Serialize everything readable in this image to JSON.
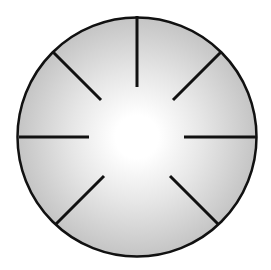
{
  "diagram": {
    "type": "circle-with-radial-spokes",
    "circle": {
      "cx": 137,
      "cy": 137,
      "r": 119.5,
      "stroke": "#111111",
      "stroke_width": 2.5
    },
    "fill_gradient": {
      "center": "#ffffff",
      "mid": "#e6e6e6",
      "edge": "#c4c4c4"
    },
    "spoke_color": "#111111",
    "spoke_width": 3,
    "spokes": [
      {
        "name": "spoke-top",
        "x1": 137,
        "y1": 16,
        "x2": 137,
        "y2": 87
      },
      {
        "name": "spoke-top-right",
        "x1": 221,
        "y1": 52,
        "x2": 173,
        "y2": 100
      },
      {
        "name": "spoke-right",
        "x1": 256,
        "y1": 137,
        "x2": 184,
        "y2": 137
      },
      {
        "name": "spoke-bottom-right",
        "x1": 218,
        "y1": 224,
        "x2": 170,
        "y2": 176
      },
      {
        "name": "spoke-bottom-left",
        "x1": 56,
        "y1": 224,
        "x2": 104,
        "y2": 176
      },
      {
        "name": "spoke-left",
        "x1": 19,
        "y1": 137,
        "x2": 89,
        "y2": 137
      },
      {
        "name": "spoke-top-left",
        "x1": 53,
        "y1": 52,
        "x2": 101,
        "y2": 100
      }
    ]
  }
}
